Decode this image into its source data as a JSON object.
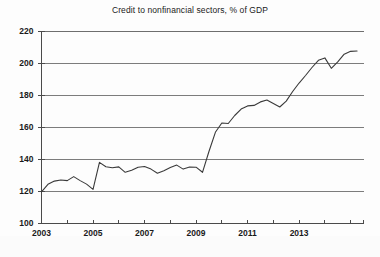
{
  "chart_data": {
    "type": "line",
    "title": "Credit to nonfinancial sectors, % of GDP",
    "xlabel": "",
    "ylabel": "",
    "ylim": [
      100,
      220
    ],
    "xlim": [
      2003.0,
      2015.5
    ],
    "ytick_values": [
      100,
      120,
      140,
      160,
      180,
      200,
      220
    ],
    "ytick_labels": [
      "100",
      "120",
      "140",
      "160",
      "180",
      "200",
      "220"
    ],
    "xtick_values": [
      2003,
      2005,
      2007,
      2009,
      2011,
      2013
    ],
    "xtick_labels": [
      "2003",
      "2005",
      "2007",
      "2009",
      "2011",
      "2013"
    ],
    "xminor_tick_values": [
      2004,
      2006,
      2008,
      2010,
      2012,
      2014,
      2015
    ],
    "grid": "horizontal",
    "legend": null,
    "line_color": "#3a3a3a",
    "series": [
      {
        "name": "Credit to nonfinancial sectors, % of GDP",
        "x": [
          2003.0,
          2003.25,
          2003.5,
          2003.75,
          2004.0,
          2004.25,
          2004.5,
          2004.75,
          2005.0,
          2005.25,
          2005.5,
          2005.75,
          2006.0,
          2006.25,
          2006.5,
          2006.75,
          2007.0,
          2007.25,
          2007.5,
          2007.75,
          2008.0,
          2008.25,
          2008.5,
          2008.75,
          2009.0,
          2009.25,
          2009.5,
          2009.75,
          2010.0,
          2010.25,
          2010.5,
          2010.75,
          2011.0,
          2011.25,
          2011.5,
          2011.75,
          2012.0,
          2012.25,
          2012.5,
          2012.75,
          2013.0,
          2013.25,
          2013.5,
          2013.75,
          2014.0,
          2014.25,
          2014.5,
          2014.75,
          2015.0,
          2015.25
        ],
        "values": [
          119.8,
          124.5,
          126.5,
          127.2,
          126.8,
          129.3,
          126.8,
          124.6,
          121.3,
          138.2,
          135.5,
          134.8,
          135.4,
          132.0,
          133.3,
          135.2,
          135.6,
          134.0,
          131.4,
          133.0,
          135.0,
          136.5,
          134.0,
          135.3,
          135.2,
          132.0,
          145.0,
          157.0,
          162.8,
          162.5,
          167.5,
          171.5,
          173.5,
          173.8,
          176.0,
          177.2,
          175.0,
          172.8,
          176.5,
          182.5,
          187.8,
          192.5,
          197.5,
          202.0,
          203.5,
          197.0,
          201.0,
          205.8,
          207.6,
          207.8
        ]
      }
    ]
  }
}
